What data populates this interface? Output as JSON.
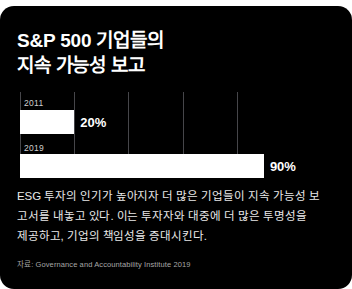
{
  "card": {
    "background_color": "#000000",
    "text_color": "#ffffff"
  },
  "title": {
    "line1": "S&P 500 기업들의",
    "line2": "지속 가능성 보고"
  },
  "body": {
    "line1": "ESG 투자의 인기가 높아지자 더 많은 기업들이 지속 가능성 보",
    "line2": "고서를 내놓고 있다. 이는 투자자와 대중에 더 많은 투명성을",
    "line3": "제공하고, 기업의 책임성을 증대시킨다."
  },
  "source": {
    "text": "자료: Governance and Accountability Institute 2019"
  },
  "chart_data": {
    "type": "bar",
    "orientation": "horizontal",
    "title": "S&P 500 기업들의 지속 가능성 보고",
    "categories": [
      "2011",
      "2019"
    ],
    "values": [
      20,
      90
    ],
    "value_labels": [
      "20%",
      "90%"
    ],
    "xlabel": "",
    "ylabel": "",
    "xlim": [
      0,
      100
    ],
    "grid": true,
    "gridline_values": [
      0,
      22,
      44,
      66,
      88
    ],
    "legend": "none",
    "bar_color": "#ffffff",
    "grid_color": "#46464a"
  }
}
